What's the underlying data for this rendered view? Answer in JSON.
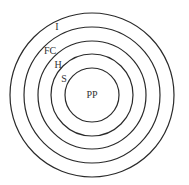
{
  "diagram": {
    "type": "concentric-circles",
    "center": [
      92,
      95
    ],
    "stroke_color": "#2a2a2a",
    "text_color": "#333333",
    "rings": [
      {
        "label": "PP",
        "radius": 27,
        "label_x": 92,
        "label_y": 98,
        "anchor": "middle"
      },
      {
        "label": "S",
        "radius": 41,
        "label_x": 64,
        "label_y": 82,
        "anchor": "middle"
      },
      {
        "label": "H",
        "radius": 54,
        "label_x": 58,
        "label_y": 68,
        "anchor": "middle"
      },
      {
        "label": "FC",
        "radius": 68,
        "label_x": 50,
        "label_y": 54,
        "anchor": "middle"
      },
      {
        "label": "I",
        "radius": 82,
        "label_x": 57,
        "label_y": 30,
        "anchor": "middle"
      }
    ]
  }
}
